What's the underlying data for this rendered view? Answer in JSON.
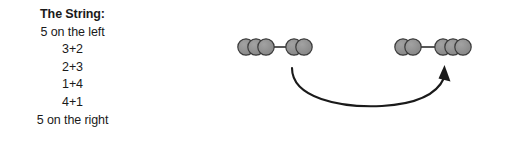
{
  "page": {
    "background": "#ffffff",
    "width": 528,
    "height": 149
  },
  "text_block": {
    "title": "The String:",
    "lines": [
      {
        "text": "The String:",
        "bold": true
      },
      {
        "text": "5 on the left",
        "bold": false
      },
      {
        "text": "3+2",
        "bold": false
      },
      {
        "text": "2+3",
        "bold": false
      },
      {
        "text": "1+4",
        "bold": false
      },
      {
        "text": "4+1",
        "bold": false
      },
      {
        "text": "5 on the right",
        "bold": false
      }
    ]
  },
  "diagram": {
    "bead_fill": "#8c8c8c",
    "bead_stroke": "#3b3b3b",
    "connector_color": "#3b3b3b",
    "arrow_color": "#1a1a1a",
    "bead_radius": 8.2,
    "groups": [
      {
        "name": "left-string",
        "left_count": 3,
        "right_count": 2,
        "total": 5,
        "split_label": "3+2"
      },
      {
        "name": "right-string",
        "left_count": 2,
        "right_count": 3,
        "total": 5,
        "split_label": "2+3"
      }
    ],
    "arrow": {
      "direction": "left-to-right",
      "style": "curved"
    }
  }
}
